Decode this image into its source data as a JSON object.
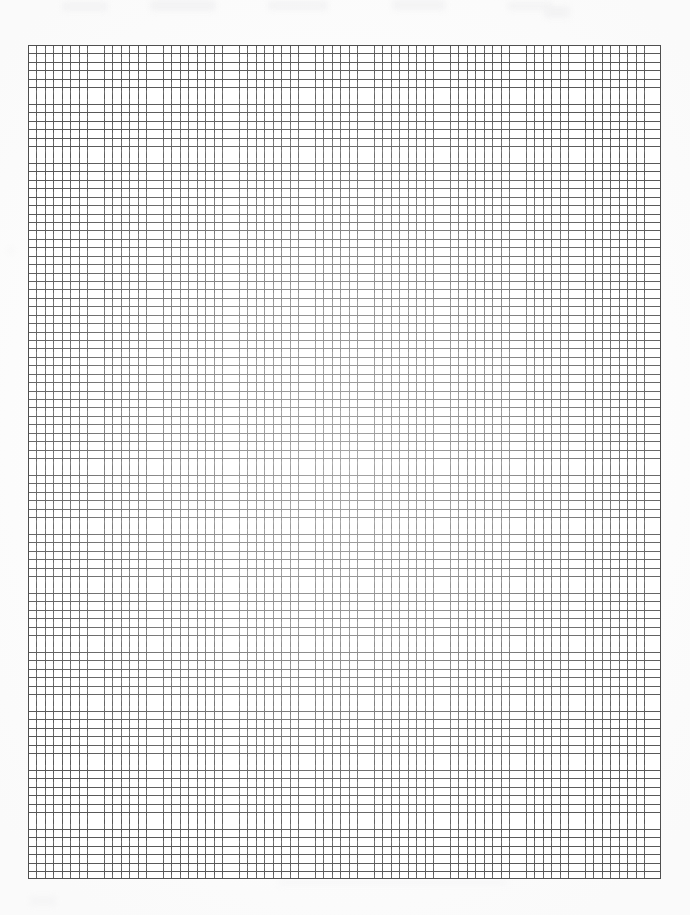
{
  "document": {
    "kind": "graph-paper-scan",
    "page_width_px": 690,
    "page_height_px": 915,
    "page_background_color": "#fefefe",
    "visible_text": "",
    "caption": ""
  },
  "grid": {
    "name": "quadrille-graph-paper",
    "left_px": 28,
    "top_px": 45,
    "width_px": 633,
    "height_px": 834,
    "cell_width_px": 8.44,
    "cell_height_px": 8.43,
    "columns": 75,
    "rows": 99,
    "line_color": "#585858",
    "border_color": "#4f4f4f",
    "line_width_px": 1,
    "major_lines": false,
    "fill_color": "#ffffff"
  },
  "scan_artifacts": {
    "vignette": "center-lightened",
    "top_smudges": 6,
    "bottom_smudges": 2,
    "smudge_color": "#f2f2f3"
  },
  "chart_data": {
    "type": "table",
    "title": "",
    "xlabel": "",
    "ylabel": "",
    "categories": [],
    "values": [],
    "grid": true,
    "legend": "none"
  }
}
